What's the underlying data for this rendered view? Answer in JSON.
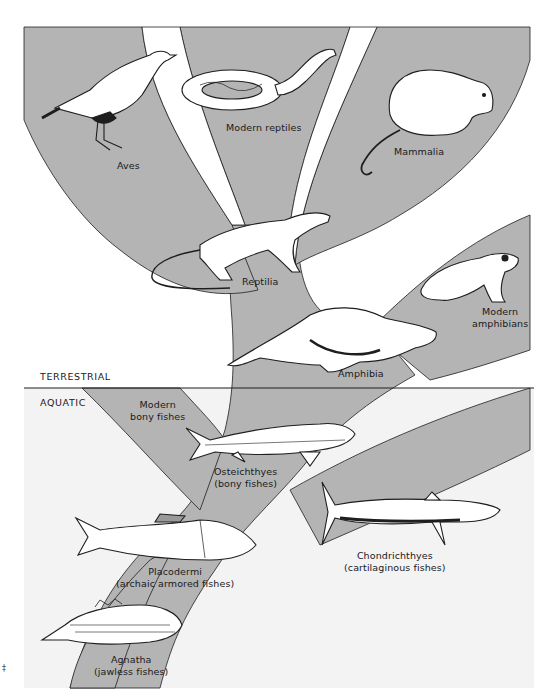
{
  "diagram": {
    "type": "phylogenetic-tree",
    "colors": {
      "branch_fill": "#b4b4b4",
      "panel_background": "#f3f3f3",
      "page_background": "#ffffff",
      "outline": "#1e1e1e",
      "animal_fill": "#ffffff"
    },
    "zones": {
      "terrestrial": "TERRESTRIAL",
      "aquatic": "AQUATIC"
    },
    "groups": {
      "aves": {
        "label": "Aves",
        "icon": "bird-icon"
      },
      "modern_reptiles": {
        "label": "Modern reptiles",
        "icon": "snake-icon"
      },
      "mammalia": {
        "label": "Mammalia",
        "icon": "opossum-icon"
      },
      "reptilia": {
        "label": "Reptilia",
        "icon": "lizard-icon"
      },
      "modern_amphibians": {
        "line1": "Modern",
        "line2": "amphibians",
        "icon": "frog-icon"
      },
      "amphibia": {
        "label": "Amphibia",
        "icon": "salamander-icon"
      },
      "modern_bony_fishes": {
        "line1": "Modern",
        "line2": "bony fishes"
      },
      "osteichthyes": {
        "line1": "Osteichthyes",
        "line2": "(bony fishes)",
        "icon": "lobe-finned-fish-icon"
      },
      "chondrichthyes": {
        "line1": "Chondrichthyes",
        "line2": "(cartilaginous fishes)",
        "icon": "shark-icon"
      },
      "placodermi": {
        "line1": "Placodermi",
        "line2": "(archaic armored fishes)",
        "icon": "armored-fish-icon"
      },
      "agnatha": {
        "line1": "Agnatha",
        "line2": "(jawless fishes)",
        "icon": "jawless-fish-icon"
      }
    },
    "stray_mark": "‡"
  }
}
